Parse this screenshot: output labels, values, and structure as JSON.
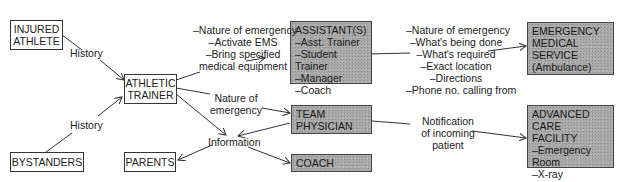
{
  "nodes": {
    "injured_athlete": {
      "lines": [
        "INJURED",
        "ATHLETE"
      ]
    },
    "bystanders": {
      "lines": [
        "BYSTANDERS"
      ]
    },
    "athletic_trainer": {
      "lines": [
        "ATHLETIC",
        "TRAINER"
      ]
    },
    "parents": {
      "lines": [
        "PARENTS"
      ]
    },
    "assistants": {
      "lines": [
        "ASSISTANT(S)",
        "–Asst. Trainer",
        "–Student Trainer",
        "–Manager",
        "–Coach"
      ]
    },
    "team_physician": {
      "lines": [
        "TEAM",
        "PHYSICIAN"
      ]
    },
    "coach": {
      "lines": [
        "COACH"
      ]
    },
    "ems": {
      "lines": [
        "EMERGENCY",
        "MEDICAL",
        "SERVICE",
        "(Ambulance)"
      ]
    },
    "advanced_care": {
      "lines": [
        "ADVANCED CARE",
        "FACILITY",
        "–Emergency Room",
        "–X-ray",
        "–Other"
      ]
    }
  },
  "edge_labels": {
    "history_top": {
      "lines": [
        "History"
      ]
    },
    "history_bottom": {
      "lines": [
        "History"
      ]
    },
    "trainer_to_assistants": {
      "lines": [
        "–Nature of emergency",
        "–Activate EMS",
        "–Bring specified",
        "medical equipment"
      ]
    },
    "trainer_to_physician": {
      "lines": [
        "Nature of",
        "emergency"
      ]
    },
    "information": {
      "lines": [
        "Information"
      ]
    },
    "assistants_to_ems": {
      "lines": [
        "–Nature of emergency",
        "–What's being done",
        "–What's required",
        "–Exact location",
        "–Directions",
        "–Phone no. calling from"
      ]
    },
    "physician_to_facility": {
      "lines": [
        "Notification",
        "of incoming",
        "patient"
      ]
    }
  },
  "colors": {
    "shaded_box": "#a8a8a8",
    "line": "#333333"
  }
}
